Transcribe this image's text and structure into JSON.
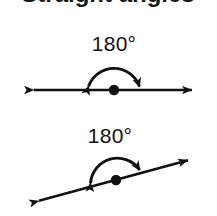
{
  "figure": {
    "background_color": "#ffffff",
    "ink_color": "#111111",
    "clipped_heading_text": "Straight angles",
    "diagrams": [
      {
        "id": "straight-angle-horizontal",
        "label": "180°",
        "label_x": 114,
        "label_y": 51,
        "line": {
          "orientation": "horizontal",
          "x1": 26,
          "y1": 90,
          "x2": 200,
          "y2": 90,
          "arrowheads": "both"
        },
        "vertex": {
          "x": 114,
          "y": 90,
          "radius": 5.2
        },
        "arc": {
          "start_x": 86,
          "start_y": 90,
          "end_x": 142,
          "end_y": 90,
          "apex_y": 61,
          "radius": 28,
          "arrowheads": "both",
          "sweep_degrees": 180
        }
      },
      {
        "id": "straight-angle-slanted",
        "label": "180°",
        "label_x": 110,
        "label_y": 143,
        "line": {
          "orientation": "slanted",
          "x1": 31,
          "y1": 203,
          "x2": 196,
          "y2": 158,
          "arrowheads": "both",
          "slope_degrees": -15.3
        },
        "vertex": {
          "x": 116,
          "y": 180,
          "radius": 5.2
        },
        "arc": {
          "start_x": 89,
          "start_y": 187,
          "end_x": 144,
          "end_y": 172,
          "apex_y": 152,
          "radius": 28,
          "arrowheads": "both",
          "sweep_degrees": 180
        }
      }
    ]
  }
}
